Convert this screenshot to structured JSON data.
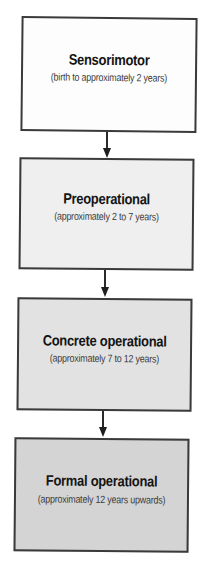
{
  "diagram": {
    "type": "flowchart",
    "direction": "top-to-bottom",
    "stages": [
      {
        "title": "Sensorimotor",
        "subtitle": "(birth to approximately 2 years)",
        "fill": "#fdfdfd"
      },
      {
        "title": "Preoperational",
        "subtitle": "(approximately 2 to 7 years)",
        "fill": "#efefef"
      },
      {
        "title": "Concrete operational",
        "subtitle": "(approximately 7 to 12 years)",
        "fill": "#e2e2e2"
      },
      {
        "title": "Formal operational",
        "subtitle": "(approximately 12 years upwards)",
        "fill": "#d4d4d4"
      }
    ],
    "connectors": [
      {
        "from": 0,
        "to": 1
      },
      {
        "from": 1,
        "to": 2
      },
      {
        "from": 2,
        "to": 3
      }
    ],
    "border_color": "#3a3a3a"
  }
}
